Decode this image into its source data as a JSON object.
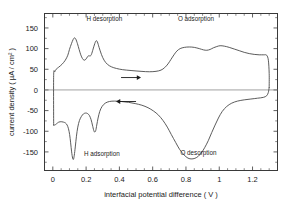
{
  "chart_data": {
    "type": "line",
    "title": "",
    "xlabel": "interfacial potential difference ( V )",
    "ylabel": "current density ( µA / cm² )",
    "xlim": [
      -0.05,
      1.35
    ],
    "ylim": [
      -195,
      185
    ],
    "grid": false,
    "legend_position": "none",
    "xticks": [
      0,
      0.2,
      0.4,
      0.6,
      0.8,
      1,
      1.2
    ],
    "xticklabels": [
      "0",
      "0.2",
      "0.4",
      "0.6",
      "0.8",
      "1",
      "1.2"
    ],
    "yticks": [
      150,
      100,
      50,
      0,
      -50,
      -100,
      -150
    ],
    "yticklabels": [
      "150",
      "100",
      "50",
      "0",
      "-50",
      "-100",
      "-150"
    ],
    "minor_xtick_step": 0.05,
    "minor_ytick_step": 25,
    "zero_line": 0,
    "annotations": [
      {
        "name": "h-desorption",
        "text": "H desorption",
        "x": 0.31,
        "y": 168
      },
      {
        "name": "o-adsorption",
        "text": "O adsorption",
        "x": 0.86,
        "y": 168
      },
      {
        "name": "h-adsorption",
        "text": "H adsorption",
        "x": 0.295,
        "y": -160
      },
      {
        "name": "o-desorption",
        "text": "O desorption",
        "x": 0.875,
        "y": -157
      }
    ],
    "arrows": [
      {
        "name": "forward-sweep-arrow",
        "direction": "right",
        "x_start": 0.41,
        "x_end": 0.53,
        "y": 30
      },
      {
        "name": "reverse-sweep-arrow",
        "direction": "left",
        "x_start": 0.5,
        "x_end": 0.38,
        "y": -28
      }
    ],
    "series": [
      {
        "name": "anodic sweep (forward, H desorption → O adsorption)",
        "color": "#4a4a4a",
        "points": [
          [
            0.005,
            -85
          ],
          [
            0.005,
            35
          ],
          [
            0.012,
            44
          ],
          [
            0.02,
            50
          ],
          [
            0.035,
            55
          ],
          [
            0.055,
            62
          ],
          [
            0.075,
            72
          ],
          [
            0.09,
            84
          ],
          [
            0.1,
            98
          ],
          [
            0.112,
            112
          ],
          [
            0.122,
            122
          ],
          [
            0.13,
            126
          ],
          [
            0.138,
            123
          ],
          [
            0.148,
            112
          ],
          [
            0.158,
            98
          ],
          [
            0.168,
            85
          ],
          [
            0.178,
            76
          ],
          [
            0.188,
            72
          ],
          [
            0.198,
            74
          ],
          [
            0.208,
            80
          ],
          [
            0.216,
            83
          ],
          [
            0.224,
            82
          ],
          [
            0.232,
            86
          ],
          [
            0.242,
            99
          ],
          [
            0.252,
            112
          ],
          [
            0.26,
            119
          ],
          [
            0.268,
            116
          ],
          [
            0.278,
            103
          ],
          [
            0.292,
            86
          ],
          [
            0.308,
            72
          ],
          [
            0.328,
            62
          ],
          [
            0.352,
            56
          ],
          [
            0.382,
            52
          ],
          [
            0.42,
            49
          ],
          [
            0.47,
            47
          ],
          [
            0.53,
            45
          ],
          [
            0.58,
            44
          ],
          [
            0.62,
            45
          ],
          [
            0.65,
            48
          ],
          [
            0.672,
            54
          ],
          [
            0.692,
            63
          ],
          [
            0.71,
            74
          ],
          [
            0.728,
            85
          ],
          [
            0.745,
            94
          ],
          [
            0.765,
            100
          ],
          [
            0.79,
            103
          ],
          [
            0.82,
            104
          ],
          [
            0.85,
            103
          ],
          [
            0.88,
            100
          ],
          [
            0.905,
            97
          ],
          [
            0.925,
            96
          ],
          [
            0.945,
            98
          ],
          [
            0.965,
            102
          ],
          [
            0.985,
            105
          ],
          [
            1.005,
            107
          ],
          [
            1.03,
            106
          ],
          [
            1.06,
            103
          ],
          [
            1.09,
            99
          ],
          [
            1.12,
            95
          ],
          [
            1.15,
            91
          ],
          [
            1.18,
            88
          ],
          [
            1.21,
            86
          ],
          [
            1.24,
            85
          ],
          [
            1.268,
            85
          ],
          [
            1.285,
            84
          ],
          [
            1.295,
            72
          ],
          [
            1.3,
            40
          ],
          [
            1.3,
            6
          ]
        ]
      },
      {
        "name": "cathodic sweep (reverse, O desorption → H adsorption)",
        "color": "#4a4a4a",
        "points": [
          [
            1.3,
            6
          ],
          [
            1.295,
            -6
          ],
          [
            1.285,
            -14
          ],
          [
            1.265,
            -18
          ],
          [
            1.23,
            -20
          ],
          [
            1.19,
            -22
          ],
          [
            1.15,
            -24
          ],
          [
            1.11,
            -27
          ],
          [
            1.075,
            -32
          ],
          [
            1.045,
            -40
          ],
          [
            1.018,
            -52
          ],
          [
            0.995,
            -68
          ],
          [
            0.975,
            -85
          ],
          [
            0.955,
            -103
          ],
          [
            0.935,
            -122
          ],
          [
            0.912,
            -140
          ],
          [
            0.888,
            -155
          ],
          [
            0.862,
            -164
          ],
          [
            0.836,
            -167
          ],
          [
            0.812,
            -165
          ],
          [
            0.788,
            -157
          ],
          [
            0.762,
            -144
          ],
          [
            0.738,
            -127
          ],
          [
            0.712,
            -108
          ],
          [
            0.688,
            -90
          ],
          [
            0.662,
            -74
          ],
          [
            0.635,
            -61
          ],
          [
            0.605,
            -51
          ],
          [
            0.572,
            -43
          ],
          [
            0.535,
            -37
          ],
          [
            0.495,
            -33
          ],
          [
            0.455,
            -30
          ],
          [
            0.412,
            -28
          ],
          [
            0.372,
            -27
          ],
          [
            0.34,
            -28
          ],
          [
            0.315,
            -32
          ],
          [
            0.296,
            -40
          ],
          [
            0.282,
            -52
          ],
          [
            0.272,
            -68
          ],
          [
            0.264,
            -85
          ],
          [
            0.258,
            -98
          ],
          [
            0.252,
            -102
          ],
          [
            0.246,
            -98
          ],
          [
            0.238,
            -85
          ],
          [
            0.23,
            -72
          ],
          [
            0.22,
            -62
          ],
          [
            0.208,
            -57
          ],
          [
            0.196,
            -56
          ],
          [
            0.184,
            -58
          ],
          [
            0.172,
            -64
          ],
          [
            0.16,
            -74
          ],
          [
            0.15,
            -90
          ],
          [
            0.142,
            -112
          ],
          [
            0.135,
            -138
          ],
          [
            0.129,
            -158
          ],
          [
            0.124,
            -168
          ],
          [
            0.119,
            -165
          ],
          [
            0.113,
            -150
          ],
          [
            0.107,
            -128
          ],
          [
            0.101,
            -108
          ],
          [
            0.094,
            -94
          ],
          [
            0.086,
            -85
          ],
          [
            0.076,
            -80
          ],
          [
            0.065,
            -78
          ],
          [
            0.054,
            -77
          ],
          [
            0.044,
            -77
          ],
          [
            0.035,
            -78
          ],
          [
            0.028,
            -80
          ],
          [
            0.022,
            -82
          ],
          [
            0.016,
            -84
          ],
          [
            0.01,
            -85
          ],
          [
            0.005,
            -85
          ]
        ]
      }
    ]
  }
}
